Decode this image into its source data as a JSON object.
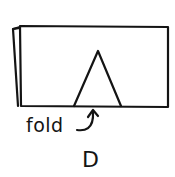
{
  "diagram": {
    "fold_label": "fold",
    "caption": "D",
    "stroke_color": "#141414",
    "background_color": "#ffffff"
  }
}
